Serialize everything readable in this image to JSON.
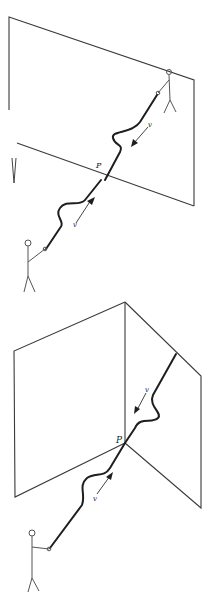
{
  "figure": {
    "panels": [
      {
        "id": "top",
        "point_label": "P",
        "velocity_labels": [
          "v",
          "v"
        ],
        "stray_mark": "V"
      },
      {
        "id": "bottom",
        "point_label": "P",
        "velocity_labels": [
          "v",
          "v"
        ]
      }
    ]
  },
  "colors": {
    "line": "#3a3a3a",
    "string": "#1e1e1e",
    "background": "#ffffff"
  }
}
